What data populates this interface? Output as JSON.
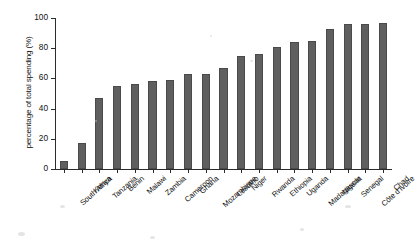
{
  "chart_data": {
    "type": "bar",
    "title": "",
    "xlabel": "",
    "ylabel": "percentage of total spending (%)",
    "ylim": [
      0,
      100
    ],
    "yticks": [
      0,
      20,
      40,
      60,
      80,
      100
    ],
    "grid": false,
    "legend": null,
    "bar_color": "#5f5f5f",
    "categories": [
      "South Africa",
      "Kenya",
      "Tanzania",
      "Benin",
      "Malawi",
      "Zambia",
      "Cameroon",
      "Ghana",
      "Mozambique",
      "Lesotho",
      "Niger",
      "Rwanda",
      "Ethiopia",
      "Uganda",
      "Madagascar",
      "Nigeria",
      "Senegal",
      "Côte d'Ivoire",
      "Chad"
    ],
    "values": [
      5,
      17,
      47,
      55,
      56,
      58,
      59,
      63,
      63,
      67,
      75,
      76,
      81,
      84,
      85,
      93,
      96,
      96,
      97
    ]
  }
}
